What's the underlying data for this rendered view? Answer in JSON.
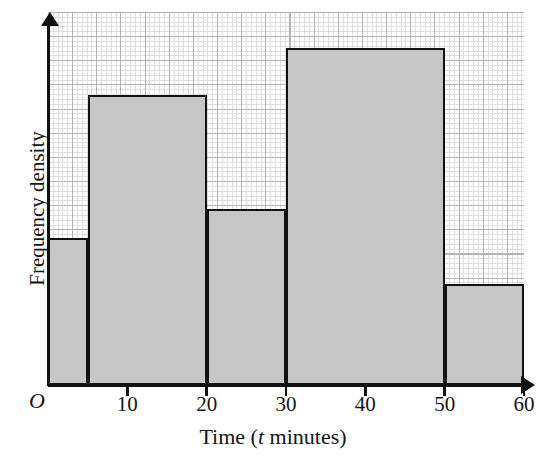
{
  "chart_data": {
    "type": "bar",
    "title": "",
    "subtitle": "",
    "xlabel_plain": "Time (t minutes)",
    "xlabel_prefix": "Time (",
    "xlabel_variable": "t",
    "xlabel_suffix": " minutes)",
    "ylabel": "Frequency density",
    "origin_label": "O",
    "grid": true,
    "grid_style": "graph-paper",
    "legend": "none",
    "xlim": [
      0,
      60
    ],
    "xticks": [
      10,
      20,
      30,
      40,
      50,
      60
    ],
    "xtick_labels": [
      "10",
      "20",
      "30",
      "40",
      "50",
      "60"
    ],
    "ylim": [
      0,
      15.5
    ],
    "yticks": [],
    "ytick_labels": [],
    "bin_edges": [
      0,
      5,
      20,
      30,
      50,
      60
    ],
    "bins": [
      {
        "label": "0 < t ≤ 5",
        "start": 0,
        "end": 5,
        "frequency_density": 6.1
      },
      {
        "label": "5 < t ≤ 20",
        "start": 5,
        "end": 20,
        "frequency_density": 12.05
      },
      {
        "label": "20 < t ≤ 30",
        "start": 20,
        "end": 30,
        "frequency_density": 7.3
      },
      {
        "label": "30 < t ≤ 50",
        "start": 30,
        "end": 50,
        "frequency_density": 14.0
      },
      {
        "label": "50 < t ≤ 60",
        "start": 50,
        "end": 60,
        "frequency_density": 4.2
      }
    ],
    "values": [
      6.1,
      12.05,
      7.3,
      14.0,
      4.2
    ],
    "categories": [
      "0-5",
      "5-20",
      "20-30",
      "30-50",
      "50-60"
    ],
    "colors": {
      "bar_fill": "#c6c6c6",
      "bar_stroke": "#111111",
      "axis": "#111111",
      "grid_minor": "#dedede",
      "grid_major": "#b4b4b4",
      "background": "#ffffff",
      "text": "#151515"
    }
  }
}
